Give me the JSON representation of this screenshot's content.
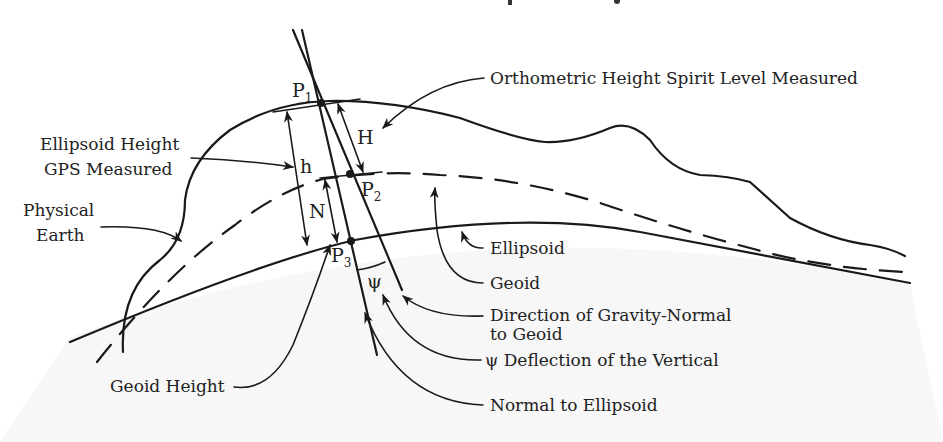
{
  "title_fragment": "p     g",
  "surfaces": {
    "physical_earth": "Physical Earth",
    "geoid": "Geoid",
    "ellipsoid": "Ellipsoid"
  },
  "points": {
    "p1": {
      "letter": "P",
      "sub": "1"
    },
    "p2": {
      "letter": "P",
      "sub": "2"
    },
    "p3": {
      "letter": "P",
      "sub": "3"
    }
  },
  "symbols": {
    "H": "H",
    "h": "h",
    "N": "N",
    "psi": "ψ"
  },
  "labels": {
    "orthometric": "Orthometric Height Spirit Level Measured",
    "ellipsoid_height_1": "Ellipsoid Height",
    "ellipsoid_height_2": "GPS Measured",
    "physical_1": "Physical",
    "physical_2": "Earth",
    "ellipsoid": "Ellipsoid",
    "geoid": "Geoid",
    "gravity_1": "Direction of Gravity-Normal",
    "gravity_2": "to Geoid",
    "deflection": "ψ Deflection of the Vertical",
    "normal_ellipsoid": "Normal to Ellipsoid",
    "geoid_height": "Geoid Height"
  },
  "colors": {
    "ink": "#1a1a1a",
    "below_ellipsoid_tint": "#f6f6f6"
  }
}
